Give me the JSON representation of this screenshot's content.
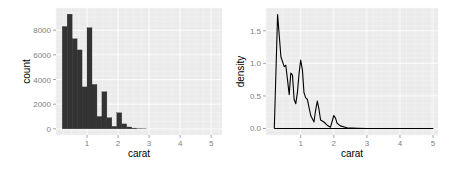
{
  "chart_data": [
    {
      "type": "bar",
      "title": "",
      "xlabel": "carat",
      "ylabel": "count",
      "xlim": [
        0,
        5.2
      ],
      "ylim": [
        0,
        9300
      ],
      "grid": true,
      "legend": null,
      "x_ticks": [
        "1",
        "2",
        "3",
        "4",
        "5"
      ],
      "y_ticks": [
        "0",
        "2000",
        "4000",
        "6000",
        "8000"
      ],
      "bin_starts": [
        0.2,
        0.36,
        0.52,
        0.68,
        0.84,
        1.0,
        1.16,
        1.32,
        1.48,
        1.64,
        1.8,
        1.96,
        2.12,
        2.28,
        2.44,
        2.6,
        2.76
      ],
      "bin_width": 0.16,
      "values": [
        8300,
        9300,
        7300,
        6400,
        3400,
        8200,
        3600,
        1000,
        3000,
        900,
        200,
        1300,
        400,
        150,
        60,
        20,
        10
      ]
    },
    {
      "type": "line",
      "title": "",
      "xlabel": "carat",
      "ylabel": "density",
      "xlim": [
        0,
        5.2
      ],
      "ylim": [
        0,
        1.8
      ],
      "grid": true,
      "legend": null,
      "x_ticks": [
        "1",
        "2",
        "3",
        "4",
        "5"
      ],
      "y_ticks": [
        "0.0",
        "0.5",
        "1.0",
        "1.5"
      ],
      "x": [
        0.2,
        0.3,
        0.4,
        0.5,
        0.55,
        0.6,
        0.65,
        0.7,
        0.75,
        0.8,
        0.85,
        0.9,
        0.95,
        1.0,
        1.05,
        1.1,
        1.15,
        1.2,
        1.3,
        1.4,
        1.45,
        1.5,
        1.55,
        1.6,
        1.7,
        1.8,
        1.9,
        2.0,
        2.05,
        2.1,
        2.2,
        2.4,
        2.7,
        3.0,
        4.0,
        5.0
      ],
      "y": [
        0.0,
        1.75,
        1.1,
        0.95,
        0.97,
        0.75,
        0.52,
        0.85,
        0.82,
        0.45,
        0.38,
        0.55,
        0.85,
        1.05,
        0.9,
        0.55,
        0.47,
        0.45,
        0.2,
        0.1,
        0.28,
        0.42,
        0.3,
        0.13,
        0.1,
        0.05,
        0.02,
        0.2,
        0.16,
        0.08,
        0.04,
        0.01,
        0.005,
        0.0,
        0.0,
        0.0
      ]
    }
  ]
}
